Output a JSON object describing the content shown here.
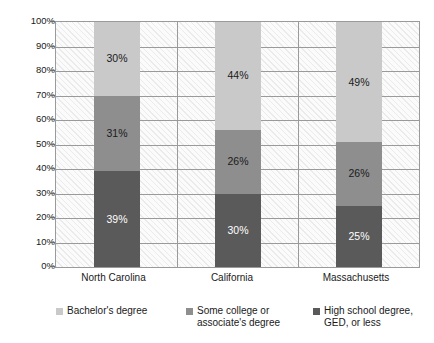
{
  "chart_data": {
    "type": "bar",
    "subtype": "stacked-bar-100",
    "title": "",
    "xlabel": "",
    "ylabel": "",
    "categories": [
      "North Carolina",
      "California",
      "Massachusetts"
    ],
    "series": [
      {
        "name": "High school degree, GED, or less",
        "color": "#5a5a5a",
        "label_color": "#ffffff",
        "values": [
          39,
          25,
          25
        ],
        "value_labels": [
          "39%",
          "30%",
          "25%"
        ]
      },
      {
        "name": "Some college or associate's degree",
        "color": "#8e8e8e",
        "label_color": "#1a1a1a",
        "values": [
          31,
          26,
          26
        ],
        "value_labels": [
          "31%",
          "26%",
          "26%"
        ]
      },
      {
        "name": "Bachelor's degree",
        "color": "#c9c9c9",
        "label_color": "#1a1a1a",
        "values": [
          30,
          44,
          49
        ],
        "value_labels": [
          "30%",
          "44%",
          "49%"
        ]
      }
    ],
    "stacks": [
      {
        "category": "North Carolina",
        "segments": [
          {
            "name": "High school degree, GED, or less",
            "value": 39,
            "label": "39%"
          },
          {
            "name": "Some college or associate's degree",
            "value": 31,
            "label": "31%"
          },
          {
            "name": "Bachelor's degree",
            "value": 30,
            "label": "30%"
          }
        ]
      },
      {
        "category": "California",
        "segments": [
          {
            "name": "High school degree, GED, or less",
            "value": 30,
            "label": "30%"
          },
          {
            "name": "Some college or associate's degree",
            "value": 26,
            "label": "26%"
          },
          {
            "name": "Bachelor's degree",
            "value": 44,
            "label": "44%"
          }
        ]
      },
      {
        "category": "Massachusetts",
        "segments": [
          {
            "name": "High school degree, GED, or less",
            "value": 25,
            "label": "25%"
          },
          {
            "name": "Some college or associate's degree",
            "value": 26,
            "label": "26%"
          },
          {
            "name": "Bachelor's degree",
            "value": 49,
            "label": "49%"
          }
        ]
      }
    ],
    "ylim": [
      0,
      100
    ],
    "y_tick_step": 10,
    "y_tick_labels": [
      "0%",
      "10%",
      "20%",
      "30%",
      "40%",
      "50%",
      "60%",
      "70%",
      "80%",
      "90%",
      "100%"
    ],
    "grid": true,
    "legend_position": "bottom"
  },
  "legend": {
    "entries": [
      {
        "label": "Bachelor's degree",
        "color": "#c9c9c9"
      },
      {
        "label": "Some college or\nassociate's degree",
        "line1": "Some college or",
        "line2": "associate's degree",
        "color": "#8e8e8e"
      },
      {
        "label": "High school degree,\nGED, or less",
        "line1": "High school degree,",
        "line2": "GED, or less",
        "color": "#5a5a5a"
      }
    ]
  },
  "colors": {
    "bachelors": "#c9c9c9",
    "some_college": "#8e8e8e",
    "high_school": "#5a5a5a",
    "grid": "#9a9a9a",
    "plot_background": "#fbfbfb",
    "text": "#1a1a1a"
  }
}
